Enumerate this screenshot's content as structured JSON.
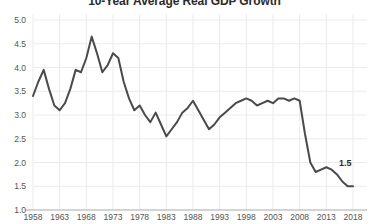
{
  "chart_data": {
    "type": "line",
    "title": "10-Year Average Real GDP Growth",
    "xlabel": "",
    "ylabel": "",
    "ylim": [
      1.0,
      5.0
    ],
    "xlim": [
      1958,
      2018
    ],
    "grid": true,
    "legend": false,
    "yticks": [
      "1.0",
      "1.5",
      "2.0",
      "2.5",
      "3.0",
      "3.5",
      "4.0",
      "4.5",
      "5.0"
    ],
    "ytick_values": [
      1.0,
      1.5,
      2.0,
      2.5,
      3.0,
      3.5,
      4.0,
      4.5,
      5.0
    ],
    "xticks": [
      "1958",
      "1963",
      "1968",
      "1973",
      "1978",
      "1983",
      "1988",
      "1993",
      "1998",
      "2003",
      "2008",
      "2013",
      "2018"
    ],
    "xtick_values": [
      1958,
      1963,
      1968,
      1973,
      1978,
      1983,
      1988,
      1993,
      1998,
      2003,
      2008,
      2013,
      2018
    ],
    "line_color": "#4a4a4a",
    "series": [
      {
        "name": "10-Year Average Real GDP Growth",
        "x": [
          1958,
          1959,
          1960,
          1961,
          1962,
          1963,
          1964,
          1965,
          1966,
          1967,
          1968,
          1969,
          1970,
          1971,
          1972,
          1973,
          1974,
          1975,
          1976,
          1977,
          1978,
          1979,
          1980,
          1981,
          1982,
          1983,
          1984,
          1985,
          1986,
          1987,
          1988,
          1989,
          1990,
          1991,
          1992,
          1993,
          1994,
          1995,
          1996,
          1997,
          1998,
          1999,
          2000,
          2001,
          2002,
          2003,
          2004,
          2005,
          2006,
          2007,
          2008,
          2009,
          2010,
          2011,
          2012,
          2013,
          2014,
          2015,
          2016,
          2017,
          2018
        ],
        "values": [
          3.4,
          3.7,
          3.95,
          3.55,
          3.2,
          3.1,
          3.25,
          3.55,
          3.95,
          3.9,
          4.2,
          4.65,
          4.3,
          3.9,
          4.05,
          4.3,
          4.2,
          3.7,
          3.35,
          3.1,
          3.2,
          3.0,
          2.85,
          3.05,
          2.8,
          2.55,
          2.7,
          2.85,
          3.05,
          3.15,
          3.3,
          3.1,
          2.9,
          2.7,
          2.8,
          2.95,
          3.05,
          3.15,
          3.25,
          3.3,
          3.35,
          3.3,
          3.2,
          3.25,
          3.3,
          3.25,
          3.35,
          3.35,
          3.3,
          3.35,
          3.3,
          2.6,
          2.0,
          1.8,
          1.85,
          1.9,
          1.85,
          1.75,
          1.6,
          1.5,
          1.5
        ]
      }
    ],
    "annotations": [
      {
        "label": "1.5",
        "x": 2018,
        "y": 1.5
      }
    ]
  }
}
